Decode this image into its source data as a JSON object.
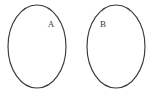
{
  "figure": {
    "type": "venn-diagram",
    "background_color": "#ffffff",
    "stroke_color": "#3a3a3a",
    "label_color": "#3c3c3c",
    "width": 153,
    "height": 94
  },
  "sets": [
    {
      "id": "set-a",
      "label": "A",
      "label_x": 51,
      "label_y": 25,
      "center_x": 37,
      "center_y": 46.5,
      "radius_x": 29,
      "radius_y": 41.5
    },
    {
      "id": "set-b",
      "label": "B",
      "label_x": 103,
      "label_y": 25,
      "center_x": 116,
      "center_y": 46.5,
      "radius_x": 29,
      "radius_y": 41.5
    }
  ]
}
